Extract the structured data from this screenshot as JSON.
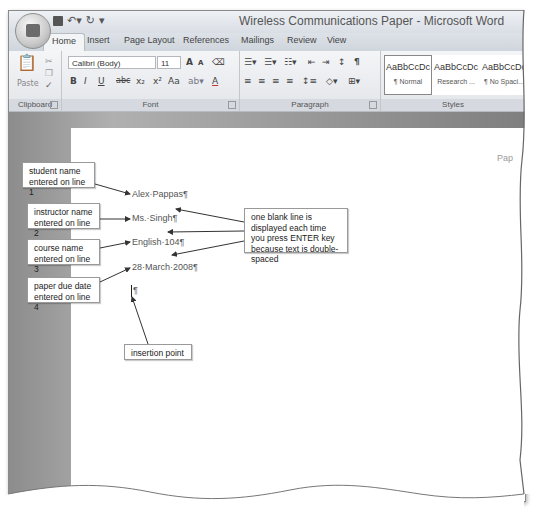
{
  "window": {
    "title": "Wireless Communications Paper - Microsoft Word"
  },
  "quick_access": {
    "items": [
      "save-icon",
      "undo-icon",
      "redo-icon",
      "customize-icon"
    ]
  },
  "tabs": [
    {
      "label": "Home",
      "active": true
    },
    {
      "label": "Insert"
    },
    {
      "label": "Page Layout"
    },
    {
      "label": "References"
    },
    {
      "label": "Mailings"
    },
    {
      "label": "Review"
    },
    {
      "label": "View"
    }
  ],
  "ribbon": {
    "clipboard": {
      "label": "Clipboard",
      "paste_label": "Paste"
    },
    "font": {
      "label": "Font",
      "font_name": "Calibri (Body)",
      "font_size": "11",
      "grow": "A",
      "shrink": "A",
      "bold": "B",
      "italic": "I",
      "underline": "U",
      "strike": "abc",
      "subscript": "x₂",
      "superscript": "x²",
      "change_case": "Aa",
      "font_color": "A"
    },
    "paragraph": {
      "label": "Paragraph",
      "show_hide": "¶"
    },
    "styles": {
      "label": "Styles",
      "items": [
        {
          "preview": "AaBbCcDc",
          "name": "¶ Normal",
          "selected": true
        },
        {
          "preview": "AaBbCcDc",
          "name": "Research ..."
        },
        {
          "preview": "AaBbCcDc",
          "name": "¶ No Spaci..."
        }
      ]
    }
  },
  "document": {
    "lines": [
      "Alex·Pappas¶",
      "Ms.·Singh¶",
      "English·104¶",
      "28·March·2008¶"
    ],
    "empty_para": "¶",
    "header_fragment": "Pap"
  },
  "callouts": {
    "student": "student name entered on line 1",
    "instructor": "instructor name entered on line 2",
    "course": "course name entered on line 3",
    "date": "paper due date entered on line 4",
    "blank_line": "one blank line is displayed each time you press ENTER key because text is double-spaced",
    "insertion": "insertion point"
  }
}
